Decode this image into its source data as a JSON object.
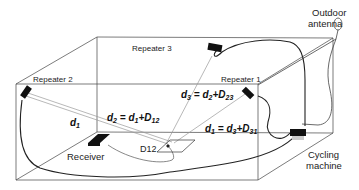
{
  "labels": {
    "outdoor_antenna_line1": "Outdoor",
    "outdoor_antenna_line2": "antenna",
    "repeater1": "Repeater 1",
    "repeater2": "Repeater 2",
    "repeater3": "Repeater 3",
    "receiver": "Receiver",
    "cycling_line1": "Cycling",
    "cycling_line2": "machine",
    "d12_marker": "D12"
  },
  "equations": {
    "d1": {
      "lhs": "d",
      "lhs_sub": "1"
    },
    "d2": {
      "lhs": "d",
      "lhs_sub": "2",
      "rhs1": "d",
      "rhs1_sub": "1",
      "plus": "+",
      "rhs2": "D",
      "rhs2_sub": "12"
    },
    "d3": {
      "lhs": "d",
      "lhs_sub": "3",
      "rhs1": "d",
      "rhs1_sub": "2",
      "plus": "+",
      "rhs2": "D",
      "rhs2_sub": "23"
    },
    "d1b": {
      "lhs": "d",
      "lhs_sub": "1",
      "rhs1": "d",
      "rhs1_sub": "3",
      "plus": "+",
      "rhs2": "D",
      "rhs2_sub": "31"
    },
    "equals": " = "
  },
  "colors": {
    "line": "#333333",
    "device": "#111111",
    "signal": "#999999"
  }
}
